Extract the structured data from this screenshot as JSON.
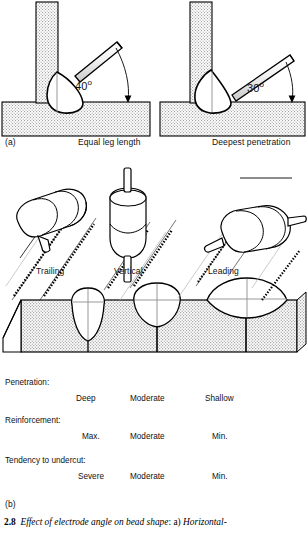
{
  "figure": {
    "number": "2.8",
    "caption_italic": "Effect of electrode angle on bead shape",
    "caption_mid": ": a) ",
    "caption_tail": "Horizontal-",
    "panel_a_label": "(a)",
    "panel_b_label": "(b)"
  },
  "panel_a": {
    "left": {
      "angle": "40",
      "degree_symbol": "o",
      "caption": "Equal leg length"
    },
    "right": {
      "angle": "30",
      "degree_symbol": "o",
      "caption": "Deepest penetration"
    }
  },
  "panel_b": {
    "torch_labels": [
      "Trailing",
      "Vertical",
      "Leading"
    ],
    "rows": [
      {
        "label": "Penetration:",
        "values": [
          "Deep",
          "Moderate",
          "Shallow"
        ]
      },
      {
        "label": "Reinforcement:",
        "values": [
          "Max.",
          "Moderate",
          "Min."
        ]
      },
      {
        "label": "Tendency to undercut:",
        "values": [
          "Severe",
          "Moderate",
          "Min."
        ]
      }
    ]
  },
  "colors": {
    "line": "#000000",
    "hatch_fill": "#d8d8d8",
    "metal_fill": "#ffffff",
    "background": "#ffffff"
  }
}
